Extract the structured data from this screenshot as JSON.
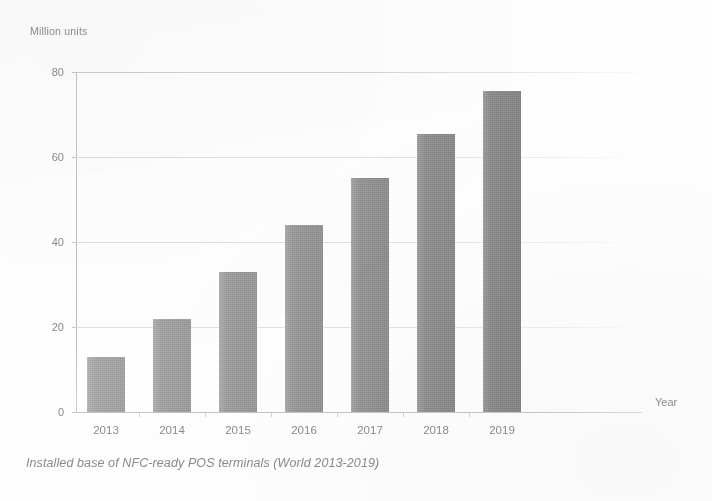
{
  "figure": {
    "unit_label": "Million units",
    "x_axis_title": "Year",
    "caption": "Installed base of NFC-ready POS terminals (World 2013-2019)"
  },
  "chart_data": {
    "type": "bar",
    "title": "Installed base of NFC-ready POS terminals (World 2013-2019)",
    "xlabel": "Year",
    "ylabel": "Million units",
    "categories": [
      "2013",
      "2014",
      "2015",
      "2016",
      "2017",
      "2018",
      "2019"
    ],
    "values": [
      13,
      22,
      33,
      44,
      55,
      65.5,
      75.5
    ],
    "ylim": [
      0,
      80
    ],
    "yticks": [
      0,
      20,
      40,
      60,
      80
    ],
    "ytick_labels": [
      "0",
      "20",
      "40",
      "60",
      "80"
    ],
    "grid": true,
    "legend": "none",
    "bar_color": "#9b9b9b",
    "background_color": "#ffffff",
    "text_color": "#8a8a8a"
  }
}
